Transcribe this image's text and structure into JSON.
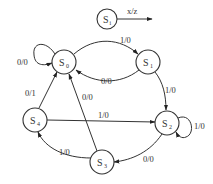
{
  "diagram": {
    "type": "state-transition-diagram",
    "legend": {
      "state": {
        "name": "S",
        "sub": "i"
      },
      "label": "x/z"
    },
    "states": [
      {
        "id": "S0",
        "name": "S",
        "sub": "0"
      },
      {
        "id": "S1",
        "name": "S",
        "sub": "1"
      },
      {
        "id": "S2",
        "name": "S",
        "sub": "2"
      },
      {
        "id": "S3",
        "name": "S",
        "sub": "3"
      },
      {
        "id": "S4",
        "name": "S",
        "sub": "4"
      }
    ],
    "transitions": [
      {
        "from": "S0",
        "to": "S0",
        "label": "0/0"
      },
      {
        "from": "S0",
        "to": "S1",
        "label": "1/0"
      },
      {
        "from": "S1",
        "to": "S0",
        "label": "0/0"
      },
      {
        "from": "S1",
        "to": "S2",
        "label": "1/0"
      },
      {
        "from": "S2",
        "to": "S2",
        "label": "1/0"
      },
      {
        "from": "S2",
        "to": "S3",
        "label": "0/0"
      },
      {
        "from": "S3",
        "to": "S4",
        "label": "1/0"
      },
      {
        "from": "S3",
        "to": "S0",
        "label": "0/0"
      },
      {
        "from": "S4",
        "to": "S0",
        "label": "0/1"
      },
      {
        "from": "S4",
        "to": "S2",
        "label": "1/0"
      }
    ]
  }
}
